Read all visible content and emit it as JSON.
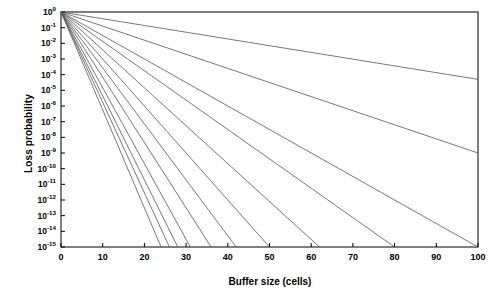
{
  "chart_data": {
    "type": "line",
    "title": "",
    "xlabel": "Buffer size (cells)",
    "ylabel": "Loss probability",
    "xlim": [
      0,
      100
    ],
    "ylim_log10": [
      -15,
      0
    ],
    "xticks": [
      0,
      10,
      20,
      30,
      40,
      50,
      60,
      70,
      80,
      90,
      100
    ],
    "xticklabels": [
      "0",
      "10",
      "20",
      "30",
      "40",
      "50",
      "60",
      "70",
      "80",
      "90",
      "100"
    ],
    "yticks_log10": [
      0,
      -1,
      -2,
      -3,
      -4,
      -5,
      -6,
      -7,
      -8,
      -9,
      -10,
      -11,
      -12,
      -13,
      -14,
      -15
    ],
    "yticklabels": [
      "10⁰",
      "10⁻¹",
      "10⁻²",
      "10⁻³",
      "10⁻⁴",
      "10⁻⁵",
      "10⁻⁶",
      "10⁻⁷",
      "10⁻⁸",
      "10⁻⁹",
      "10⁻¹⁰",
      "10⁻¹¹",
      "10⁻¹²",
      "10⁻¹³",
      "10⁻¹⁴",
      "10⁻¹⁵"
    ],
    "ytick_mantissa": [
      "10",
      "10",
      "10",
      "10",
      "10",
      "10",
      "10",
      "10",
      "10",
      "10",
      "10",
      "10",
      "10",
      "10",
      "10",
      "10"
    ],
    "ytick_exponent": [
      "0",
      "-1",
      "-2",
      "-3",
      "-4",
      "-5",
      "-6",
      "-7",
      "-8",
      "-9",
      "-10",
      "-11",
      "-12",
      "-13",
      "-14",
      "-15"
    ],
    "grid": false,
    "legend": null,
    "line_color": "#555555",
    "axis_color": "#000000",
    "background": "#ffffff",
    "series": [
      {
        "name": "decay-1",
        "slope_log10_per_cell": -0.043,
        "x_end": 100,
        "y_end_log10": -4.3
      },
      {
        "name": "decay-2",
        "slope_log10_per_cell": -0.09,
        "x_end": 100,
        "y_end_log10": -9.0
      },
      {
        "name": "decay-3",
        "slope_log10_per_cell": -0.15,
        "x_end": 100,
        "y_end_log10": -15.0
      },
      {
        "name": "decay-4",
        "slope_log10_per_cell": -0.1875,
        "x_end": 80,
        "y_end_log10": -15.0
      },
      {
        "name": "decay-5",
        "slope_log10_per_cell": -0.2419,
        "x_end": 62,
        "y_end_log10": -15.0
      },
      {
        "name": "decay-6",
        "slope_log10_per_cell": -0.3,
        "x_end": 50,
        "y_end_log10": -15.0
      },
      {
        "name": "decay-7",
        "slope_log10_per_cell": -0.3571,
        "x_end": 42,
        "y_end_log10": -15.0
      },
      {
        "name": "decay-8",
        "slope_log10_per_cell": -0.4167,
        "x_end": 36,
        "y_end_log10": -15.0
      },
      {
        "name": "decay-9",
        "slope_log10_per_cell": -0.4839,
        "x_end": 31,
        "y_end_log10": -15.0
      },
      {
        "name": "decay-10",
        "slope_log10_per_cell": -0.5357,
        "x_end": 28,
        "y_end_log10": -15.0
      },
      {
        "name": "decay-11",
        "slope_log10_per_cell": -0.5769,
        "x_end": 26,
        "y_end_log10": -15.0
      },
      {
        "name": "decay-12",
        "slope_log10_per_cell": -0.625,
        "x_end": 24,
        "y_end_log10": -15.0
      }
    ]
  }
}
